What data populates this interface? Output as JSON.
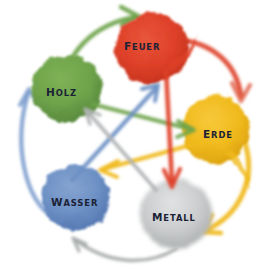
{
  "diagram": {
    "background": "#ffffff",
    "width": 267,
    "height": 271
  },
  "elements": [
    {
      "id": "feuer",
      "label": "FEUER",
      "initial": "F",
      "rest": "EUER",
      "color": "#de4028",
      "edge": "#c5331d",
      "cx": 152,
      "cy": 48,
      "rx": 38,
      "ry": 36
    },
    {
      "id": "holz",
      "label": "HOLZ",
      "initial": "H",
      "rest": "OLZ",
      "color": "#6ea34a",
      "edge": "#52813a",
      "cx": 67,
      "cy": 88,
      "rx": 35,
      "ry": 34
    },
    {
      "id": "erde",
      "label": "ERDE",
      "initial": "E",
      "rest": "RDE",
      "color": "#f0b91c",
      "edge": "#d79d0e",
      "cx": 216,
      "cy": 130,
      "rx": 35,
      "ry": 35
    },
    {
      "id": "wasser",
      "label": "WASSER",
      "initial": "W",
      "rest": "ASSER",
      "color": "#6b8fc4",
      "edge": "#4f74ae",
      "cx": 76,
      "cy": 197,
      "rx": 35,
      "ry": 34
    },
    {
      "id": "metall",
      "label": "METALL",
      "initial": "M",
      "rest": "ETALL",
      "color": "#c5c7c8",
      "edge": "#a8abad",
      "cx": 176,
      "cy": 214,
      "rx": 37,
      "ry": 36
    }
  ],
  "cycles": {
    "generating": {
      "name": "Nährungszyklus",
      "arrows": [
        {
          "id": "holz-feuer",
          "from": "HOLZ",
          "to": "FEUER",
          "color": "#6ea34a"
        },
        {
          "id": "feuer-erde",
          "from": "FEUER",
          "to": "ERDE",
          "color": "#de4028"
        },
        {
          "id": "erde-metall",
          "from": "ERDE",
          "to": "METALL",
          "color": "#f0b91c"
        },
        {
          "id": "metall-wasser",
          "from": "METALL",
          "to": "WASSER",
          "color": "#a9acad"
        },
        {
          "id": "wasser-holz",
          "from": "WASSER",
          "to": "HOLZ",
          "color": "#7b9ccd"
        }
      ]
    },
    "controlling": {
      "name": "Kontrollzyklus",
      "arrows": [
        {
          "id": "holz-erde",
          "from": "HOLZ",
          "to": "ERDE",
          "color": "#6ea34a"
        },
        {
          "id": "erde-wasser",
          "from": "ERDE",
          "to": "WASSER",
          "color": "#f0b91c"
        },
        {
          "id": "wasser-feuer",
          "from": "WASSER",
          "to": "FEUER",
          "color": "#6b8fc4"
        },
        {
          "id": "feuer-metall",
          "from": "FEUER",
          "to": "METALL",
          "color": "#de4028"
        },
        {
          "id": "metall-holz",
          "from": "METALL",
          "to": "HOLZ",
          "color": "#b0b3b4"
        }
      ]
    }
  }
}
